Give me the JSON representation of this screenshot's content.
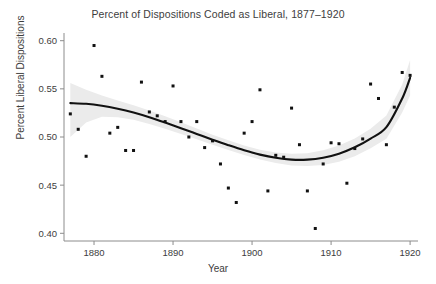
{
  "chart_data": {
    "type": "scatter",
    "title": "Percent of Dispositions Coded as Liberal, 1877–1920",
    "xlabel": "Year",
    "ylabel": "Percent Liberal Dispositions",
    "xlim": [
      1876.2,
      1921.0
    ],
    "ylim": [
      0.392,
      0.608
    ],
    "grid": false,
    "legend": null,
    "xticks": [
      1880,
      1890,
      1900,
      1910,
      1920
    ],
    "xtick_labels": [
      "1880",
      "1890",
      "1900",
      "1910",
      "1920"
    ],
    "yticks": [
      0.4,
      0.45,
      0.5,
      0.55,
      0.6
    ],
    "ytick_labels": [
      "0.40",
      "0.45",
      "0.50",
      "0.55",
      "0.60"
    ],
    "point_color": "#111111",
    "line_color": "#111111",
    "band_color": "#ebebeb",
    "axis_color": "#8c8c8c",
    "series": [
      {
        "name": "Annual percent liberal dispositions",
        "type": "scatter",
        "x": [
          1877,
          1878,
          1879,
          1880,
          1881,
          1882,
          1883,
          1884,
          1885,
          1886,
          1887,
          1888,
          1889,
          1890,
          1891,
          1892,
          1893,
          1894,
          1895,
          1896,
          1897,
          1898,
          1899,
          1900,
          1901,
          1902,
          1903,
          1904,
          1905,
          1906,
          1907,
          1908,
          1909,
          1910,
          1911,
          1912,
          1913,
          1914,
          1915,
          1916,
          1917,
          1918,
          1919,
          1920
        ],
        "y": [
          0.524,
          0.508,
          0.48,
          0.595,
          0.563,
          0.504,
          0.51,
          0.486,
          0.486,
          0.557,
          0.526,
          0.522,
          0.516,
          0.553,
          0.516,
          0.5,
          0.516,
          0.489,
          0.496,
          0.472,
          0.447,
          0.432,
          0.504,
          0.516,
          0.549,
          0.444,
          0.481,
          0.479,
          0.53,
          0.492,
          0.444,
          0.405,
          0.472,
          0.494,
          0.493,
          0.452,
          0.488,
          0.498,
          0.555,
          0.54,
          0.492,
          0.531,
          0.567,
          0.564
        ]
      },
      {
        "name": "LOESS smooth",
        "type": "line",
        "x": [
          1877,
          1879,
          1881,
          1883,
          1885,
          1887,
          1889,
          1891,
          1893,
          1895,
          1897,
          1899,
          1901,
          1903,
          1905,
          1907,
          1909,
          1911,
          1913,
          1915,
          1917,
          1919,
          1920
        ],
        "y": [
          0.5352,
          0.5345,
          0.5325,
          0.5294,
          0.5254,
          0.5205,
          0.515,
          0.5092,
          0.5032,
          0.4972,
          0.4915,
          0.4862,
          0.4817,
          0.4784,
          0.4765,
          0.4765,
          0.4785,
          0.4827,
          0.4893,
          0.4984,
          0.5102,
          0.54,
          0.5615
        ]
      },
      {
        "name": "95% confidence band upper",
        "type": "line",
        "x": [
          1877,
          1879,
          1881,
          1883,
          1885,
          1887,
          1889,
          1891,
          1893,
          1895,
          1897,
          1899,
          1901,
          1903,
          1905,
          1907,
          1909,
          1911,
          1913,
          1915,
          1917,
          1919,
          1920
        ],
        "y": [
          0.556,
          0.549,
          0.543,
          0.5378,
          0.533,
          0.5275,
          0.5215,
          0.5152,
          0.5087,
          0.5024,
          0.4966,
          0.4912,
          0.4868,
          0.4838,
          0.4825,
          0.4832,
          0.4862,
          0.4912,
          0.4985,
          0.5085,
          0.5222,
          0.5545,
          0.58
        ]
      },
      {
        "name": "95% confidence band lower",
        "type": "line",
        "x": [
          1877,
          1879,
          1881,
          1883,
          1885,
          1887,
          1889,
          1891,
          1893,
          1895,
          1897,
          1899,
          1901,
          1903,
          1905,
          1907,
          1909,
          1911,
          1913,
          1915,
          1917,
          1919,
          1920
        ],
        "y": [
          0.5,
          0.515,
          0.521,
          0.5206,
          0.5178,
          0.5135,
          0.5085,
          0.5032,
          0.4977,
          0.492,
          0.4864,
          0.4812,
          0.4766,
          0.473,
          0.4705,
          0.4698,
          0.4708,
          0.4742,
          0.4801,
          0.4883,
          0.4982,
          0.5255,
          0.543
        ]
      }
    ]
  }
}
